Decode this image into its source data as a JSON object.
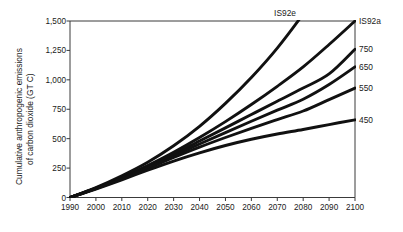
{
  "chart_data": {
    "type": "line",
    "title": "",
    "subtitle": "",
    "xlabel": "",
    "ylabel": "Cumulative anthropogenic emissions of carbon dioxide (GT C)",
    "ylabel_line1": "Cumulative anthropogenic emissions",
    "ylabel_line2": "of carbon dioxide (GT C)",
    "xlim": [
      1990,
      2100
    ],
    "ylim": [
      0,
      1500
    ],
    "grid": false,
    "legend_position": "right-of-line-ends",
    "x_ticks": [
      1990,
      2000,
      2010,
      2020,
      2030,
      2040,
      2050,
      2060,
      2070,
      2080,
      2090,
      2100
    ],
    "x_tick_labels": [
      "1990",
      "2000",
      "2010",
      "2020",
      "2030",
      "2040",
      "2050",
      "2060",
      "2070",
      "2080",
      "2090",
      "2100"
    ],
    "y_ticks": [
      0,
      250,
      500,
      750,
      1000,
      1250,
      1500
    ],
    "y_tick_labels": [
      "0",
      "250",
      "500",
      "750",
      "1,000",
      "1,250",
      "1,500"
    ],
    "x": [
      1990,
      2000,
      2010,
      2020,
      2030,
      2040,
      2050,
      2060,
      2070,
      2080,
      2090,
      2100
    ],
    "series": [
      {
        "name": "IS92e",
        "label": "IS92e",
        "color": "#111111",
        "clipped_at_top": true,
        "label_x": 2073,
        "label_y": 1585,
        "values": [
          0,
          85,
          185,
          300,
          440,
          605,
          800,
          1020,
          1270,
          1560,
          1880,
          2240
        ]
      },
      {
        "name": "IS92a",
        "label": "IS92a",
        "color": "#111111",
        "clipped_at_top": false,
        "label_x": 2103,
        "label_y": 1500,
        "values": [
          0,
          80,
          170,
          272,
          385,
          510,
          645,
          790,
          945,
          1110,
          1300,
          1500
        ]
      },
      {
        "name": "750",
        "label": "750",
        "color": "#111111",
        "clipped_at_top": false,
        "label_x": 2103,
        "label_y": 1260,
        "values": [
          0,
          78,
          165,
          262,
          368,
          480,
          592,
          705,
          818,
          930,
          1050,
          1260
        ]
      },
      {
        "name": "650",
        "label": "650",
        "color": "#111111",
        "clipped_at_top": false,
        "label_x": 2103,
        "label_y": 1110,
        "values": [
          0,
          77,
          162,
          255,
          355,
          455,
          552,
          648,
          742,
          835,
          960,
          1110
        ]
      },
      {
        "name": "550",
        "label": "550",
        "color": "#111111",
        "clipped_at_top": false,
        "label_x": 2103,
        "label_y": 930,
        "values": [
          0,
          75,
          158,
          248,
          340,
          428,
          510,
          588,
          662,
          735,
          832,
          930
        ]
      },
      {
        "name": "450",
        "label": "450",
        "color": "#111111",
        "clipped_at_top": false,
        "label_x": 2103,
        "label_y": 660,
        "values": [
          0,
          72,
          150,
          232,
          310,
          380,
          442,
          495,
          540,
          578,
          620,
          660
        ]
      }
    ]
  },
  "colors": {
    "axis": "#3a3a3a",
    "line": "#111111",
    "text": "#1a1a1a",
    "background": "#ffffff"
  }
}
